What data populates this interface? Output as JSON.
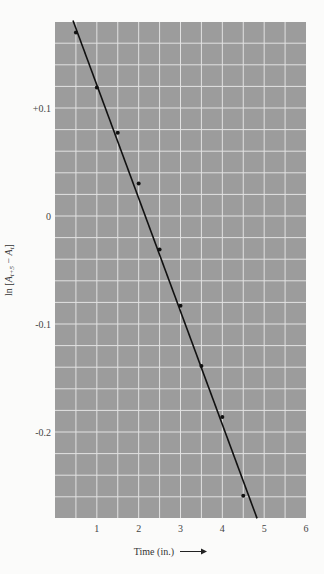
{
  "chart_data": {
    "type": "scatter",
    "title": "",
    "xlabel": "Time (in.)",
    "xlabel_arrow": "→",
    "ylabel": "ln [A_{t+5} − A_t]",
    "ylabel_parts": {
      "prefix": "ln [",
      "a1": "A",
      "sub1": "t+5",
      "minus": " − ",
      "a2": "A",
      "sub2": "t",
      "suffix": "]"
    },
    "xlim": [
      0,
      6
    ],
    "ylim": [
      -0.278,
      0.18
    ],
    "x_ticks": [
      1,
      2,
      3,
      4,
      5,
      6
    ],
    "x_tick_labels": [
      "1",
      "2",
      "3",
      "4",
      "5",
      "6"
    ],
    "y_ticks": [
      0.1,
      0,
      -0.1,
      -0.2
    ],
    "y_tick_labels": [
      "+0.1",
      "0",
      "-0.1",
      "-0.2"
    ],
    "grid": true,
    "grid_x_step": 0.5,
    "grid_y_step": 0.02,
    "legend": null,
    "series": [
      {
        "name": "measured points",
        "kind": "points",
        "x": [
          0.5,
          1.0,
          1.5,
          2.0,
          2.5,
          3.0,
          3.5,
          4.0,
          4.5
        ],
        "y": [
          0.17,
          0.119,
          0.077,
          0.03,
          -0.031,
          -0.083,
          -0.139,
          -0.186,
          -0.259
        ]
      },
      {
        "name": "fitted line",
        "kind": "line",
        "x": [
          0.43,
          4.83
        ],
        "y": [
          0.181,
          -0.28
        ]
      }
    ]
  },
  "colors": {
    "plot_background": "#9c9c9c",
    "grid": "#e2e2e2",
    "line": "#111111",
    "points": "#111111",
    "page": "#fbfbfa"
  }
}
